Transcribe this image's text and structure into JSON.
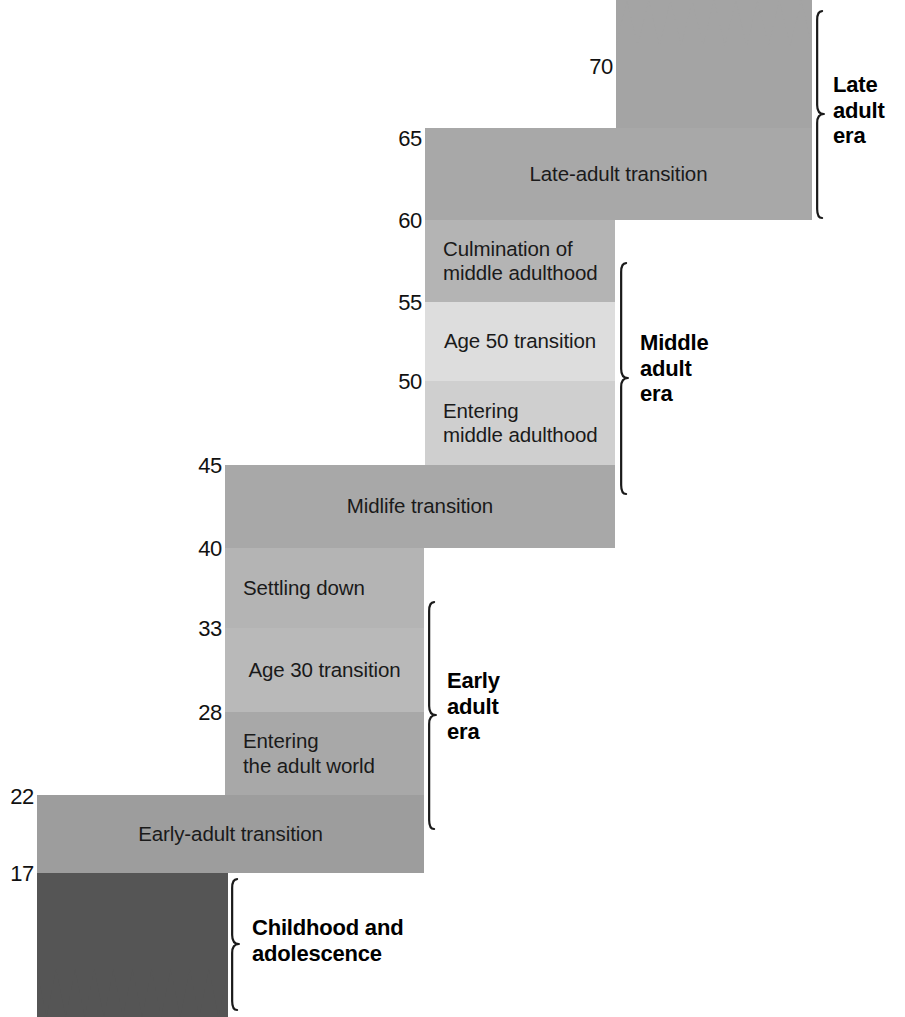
{
  "figure": {
    "kind": "levinson-seasons-of-life-diagram",
    "background": "#ffffff",
    "text_color": "#1a1a1a"
  },
  "palette": {
    "transition_dark": "#9d9d9d",
    "transition_mid": "#a8a8a8",
    "stable_mid": "#b4b4b4",
    "stable_light": "#cfcfcf",
    "stable_lightest": "#dddddd",
    "childhood_dark": "#555555",
    "late_era_block": "#a4a4a4"
  },
  "age_ticks": [
    {
      "value": "70",
      "x": 583,
      "y": 56
    },
    {
      "value": "65",
      "x": 392,
      "y": 128
    },
    {
      "value": "60",
      "x": 392,
      "y": 210
    },
    {
      "value": "55",
      "x": 392,
      "y": 292
    },
    {
      "value": "50",
      "x": 392,
      "y": 371
    },
    {
      "value": "45",
      "x": 192,
      "y": 455
    },
    {
      "value": "40",
      "x": 192,
      "y": 538
    },
    {
      "value": "33",
      "x": 192,
      "y": 618
    },
    {
      "value": "28",
      "x": 192,
      "y": 702
    },
    {
      "value": "22",
      "x": 4,
      "y": 786
    },
    {
      "value": "17",
      "x": 4,
      "y": 863
    }
  ],
  "bands": [
    {
      "id": "late-adulthood-block",
      "label": "",
      "x": 616,
      "y": 0,
      "w": 196,
      "h": 128,
      "color": "#a4a4a4",
      "align": "center",
      "has_top_zigzag": true
    },
    {
      "id": "late-adult-transition",
      "label": "Late-adult transition",
      "x": 425,
      "y": 128,
      "w": 387,
      "h": 92,
      "color": "#a8a8a8",
      "align": "center"
    },
    {
      "id": "culmination-of-middle-adulthood",
      "label": "Culmination of\nmiddle adulthood",
      "x": 425,
      "y": 220,
      "w": 190,
      "h": 82,
      "color": "#b4b4b4",
      "align": "left"
    },
    {
      "id": "age-50-transition",
      "label": "Age 50 transition",
      "x": 425,
      "y": 302,
      "w": 190,
      "h": 79,
      "color": "#dddddd",
      "align": "center"
    },
    {
      "id": "entering-middle-adulthood",
      "label": "Entering\nmiddle adulthood",
      "x": 425,
      "y": 381,
      "w": 190,
      "h": 84,
      "color": "#cfcfcf",
      "align": "left"
    },
    {
      "id": "midlife-transition",
      "label": "Midlife transition",
      "x": 225,
      "y": 465,
      "w": 390,
      "h": 83,
      "color": "#a8a8a8",
      "align": "center"
    },
    {
      "id": "settling-down",
      "label": "Settling down",
      "x": 225,
      "y": 548,
      "w": 199,
      "h": 80,
      "color": "#b4b4b4",
      "align": "left"
    },
    {
      "id": "age-30-transition",
      "label": "Age 30 transition",
      "x": 225,
      "y": 628,
      "w": 199,
      "h": 84,
      "color": "#b9b9b9",
      "align": "center"
    },
    {
      "id": "entering-the-adult-world",
      "label": "Entering\nthe adult world",
      "x": 225,
      "y": 712,
      "w": 199,
      "h": 83,
      "color": "#a8a8a8",
      "align": "left"
    },
    {
      "id": "early-adult-transition",
      "label": "Early-adult transition",
      "x": 37,
      "y": 795,
      "w": 387,
      "h": 78,
      "color": "#9d9d9d",
      "align": "center"
    },
    {
      "id": "childhood-block",
      "label": "",
      "x": 37,
      "y": 873,
      "w": 191,
      "h": 144,
      "color": "#555555",
      "align": "center",
      "has_bottom_zigzag": true
    }
  ],
  "eras": [
    {
      "id": "late-adult-era",
      "label": "Late\nadult\nera",
      "brace_x": 818,
      "brace_y": 10,
      "brace_h": 208,
      "text_x": 833,
      "text_y": 72
    },
    {
      "id": "middle-adult-era",
      "label": "Middle\nadult\nera",
      "brace_x": 622,
      "brace_y": 262,
      "brace_h": 232,
      "text_x": 640,
      "text_y": 330
    },
    {
      "id": "early-adult-era",
      "label": "Early\nadult\nera",
      "brace_x": 430,
      "brace_y": 601,
      "brace_h": 228,
      "text_x": 447,
      "text_y": 668
    },
    {
      "id": "childhood-era",
      "label": "Childhood and\nadolescence",
      "brace_x": 233,
      "brace_y": 878,
      "brace_h": 132,
      "text_x": 252,
      "text_y": 915
    }
  ],
  "zigzags": {
    "top": {
      "x": 616,
      "y": 0,
      "w": 196,
      "teeth": 9,
      "depth": 46,
      "color": "#a4a4a4"
    },
    "bottom": {
      "x": 37,
      "y": 0,
      "w": 191,
      "teeth": 10,
      "depth": 48,
      "color": "#555555"
    }
  }
}
